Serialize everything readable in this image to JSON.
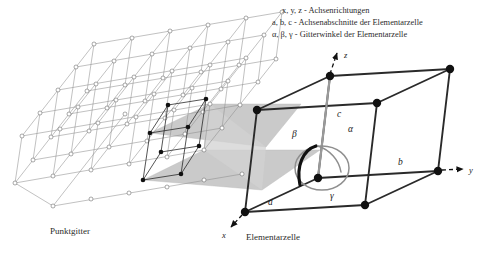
{
  "figure": {
    "background_color": "#ffffff"
  },
  "legend": {
    "lines": [
      {
        "symbols": "x, y, z",
        "separator": " - ",
        "description": "Achsenrichtungen",
        "full": "x, y, z - Achsenrichtungen"
      },
      {
        "symbols": "a, b, c",
        "separator": " - ",
        "description": "Achsenabschnitte der Elementarzelle",
        "full": "a, b, c - Achsenabschnitte der Elementarzelle"
      },
      {
        "symbols": "α, β, γ",
        "separator": " - ",
        "description": "Gitterwinkel der Elementarzelle",
        "full": "α, β, γ - Gitterwinkel der Elementarzelle"
      }
    ]
  },
  "captions": {
    "lattice": "Punktgitter",
    "unit_cell": "Elementarzelle"
  },
  "axes": [
    {
      "name": "x",
      "label": "x",
      "style": "dashed-arrow",
      "direction": "down-left"
    },
    {
      "name": "y",
      "label": "y",
      "style": "dashed-arrow",
      "direction": "right"
    },
    {
      "name": "z",
      "label": "z",
      "style": "dashed-arrow",
      "direction": "up"
    }
  ],
  "unit_cell": {
    "edge_labels": [
      {
        "name": "a",
        "label": "a"
      },
      {
        "name": "b",
        "label": "b"
      },
      {
        "name": "c",
        "label": "c"
      }
    ],
    "angle_labels": [
      {
        "name": "alpha",
        "label": "α"
      },
      {
        "name": "beta",
        "label": "β"
      },
      {
        "name": "gamma",
        "label": "γ"
      }
    ],
    "vertex_count": 8,
    "vertex_style": "filled-black-dot"
  },
  "lattice": {
    "node_style": "open-circle",
    "rows": 6,
    "cols": 6,
    "layers": 2,
    "highlighted_cell_nodes": 8
  },
  "colors": {
    "line_dark": "#1a1a1a",
    "line_light": "#8a8a8a",
    "band_fill": "#c9c9c9",
    "node_fill": "#ffffff",
    "text": "#2b2b2b",
    "arc_gray": "#8f8f8f"
  }
}
